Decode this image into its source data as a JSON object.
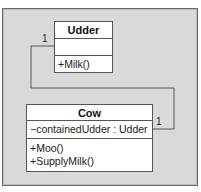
{
  "diagram": {
    "type": "uml-class",
    "classes": [
      {
        "name": "Udder",
        "attributes": [],
        "methods": [
          "+Milk()"
        ]
      },
      {
        "name": "Cow",
        "attributes": [
          "−containedUdder : Udder"
        ],
        "methods": [
          "+Moo()",
          "+SupplyMilk()"
        ]
      }
    ],
    "association": {
      "from": "Cow",
      "to": "Udder",
      "multiplicity_udder_end": "1",
      "multiplicity_cow_end": "1"
    },
    "colors": {
      "background": "#d9d9d9",
      "box": "#ffffff",
      "line": "#555555"
    }
  }
}
